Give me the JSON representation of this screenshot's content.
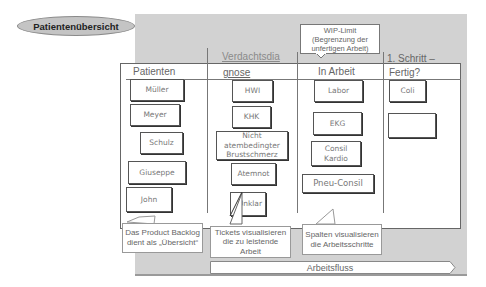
{
  "title_ellipse": {
    "label": "Patientenübersicht"
  },
  "wip_callout": {
    "text": "WIP-Limit (Begrenzung der unfertigen Arbeit)"
  },
  "columns": [
    {
      "label": "Patienten"
    },
    {
      "label_line1": "Verdachtsdia",
      "label_line2": "gnose"
    },
    {
      "label": "In Arbeit"
    },
    {
      "label_line1": "1. Schritt –",
      "label_line2": "Fertig?"
    }
  ],
  "cards": {
    "patienten": [
      "Müller",
      "Meyer",
      "Schulz",
      "Giuseppe",
      "John"
    ],
    "verdachtsdiagnose": [
      "HWI",
      "KHK",
      "Nicht atembedingter Brustschmerz",
      "Atemnot",
      "Unklar"
    ],
    "in_arbeit": [
      "Labor",
      "EKG",
      "Consil Kardio",
      "Pneu-Consil"
    ],
    "fertig": [
      "Coli",
      "T-Erhöhung"
    ]
  },
  "callouts": {
    "backlog": "Das Product Backlog dient als „Übersicht“",
    "tickets": "Tickets visualisieren die zu leistende Arbeit",
    "spalten": "Spalten visualisieren die Arbeitsschritte"
  },
  "flow_arrow": {
    "label": "Arbeitsfluss"
  },
  "colors": {
    "panel_gray": "#d2d2d2",
    "ellipse_gray": "#c4c4c4",
    "board_white": "#ffffff",
    "line_gray": "#777777"
  }
}
